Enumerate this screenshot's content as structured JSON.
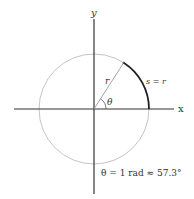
{
  "diagram": {
    "axes": {
      "x_label": "x",
      "y_label": "y"
    },
    "labels": {
      "radius": "r",
      "angle": "θ",
      "arc": "s = r",
      "equation": "θ = 1 rad ≈ 57.3°"
    },
    "geometry": {
      "center": [
        94,
        109
      ],
      "radius": 55,
      "angle_deg": 57.3
    },
    "colors": {
      "axis": "#333333",
      "circle": "#b5b5b5",
      "arc": "#222222",
      "radius_line": "#9a9a9a"
    }
  }
}
